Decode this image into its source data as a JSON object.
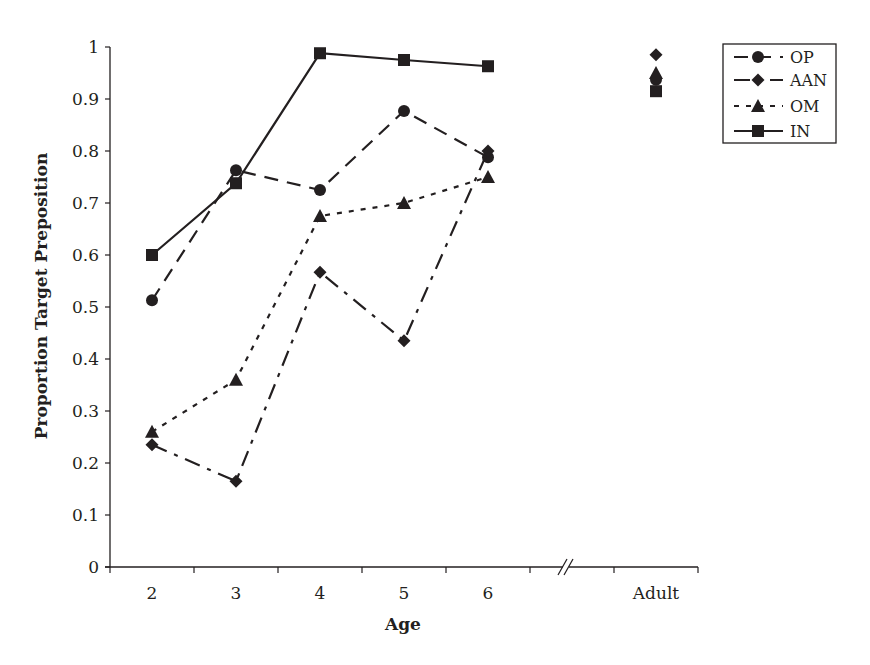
{
  "chart_data": {
    "type": "line",
    "title": "",
    "xlabel": "Age",
    "ylabel": "Proportion Target Preposition",
    "categories": [
      "2",
      "3",
      "4",
      "5",
      "6",
      "",
      "Adult"
    ],
    "axis_break_after": "6",
    "ylim": [
      0,
      1
    ],
    "yticks": [
      "0",
      "0.1",
      "0.2",
      "0.3",
      "0.4",
      "0.5",
      "0.6",
      "0.7",
      "0.8",
      "0.9",
      "1"
    ],
    "grid": false,
    "legend_position": "upper right, outside plot",
    "series": [
      {
        "name": "OP",
        "marker": "circle",
        "line_style": "long-dash",
        "values": [
          0.513,
          0.763,
          0.725,
          0.877,
          0.788,
          null,
          0.937
        ]
      },
      {
        "name": "AAN",
        "marker": "diamond",
        "line_style": "dash-dot",
        "values": [
          0.235,
          0.165,
          0.567,
          0.435,
          0.8,
          null,
          0.985
        ]
      },
      {
        "name": "OM",
        "marker": "triangle",
        "line_style": "dotted",
        "values": [
          0.26,
          0.36,
          0.675,
          0.7,
          0.75,
          null,
          0.95
        ]
      },
      {
        "name": "IN",
        "marker": "square",
        "line_style": "solid",
        "values": [
          0.6,
          0.738,
          0.988,
          0.975,
          0.963,
          null,
          0.915
        ]
      }
    ]
  },
  "colors": {
    "ink": "#231f20",
    "background": "#ffffff"
  }
}
